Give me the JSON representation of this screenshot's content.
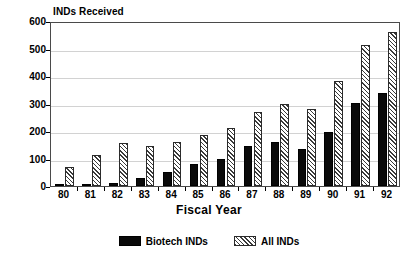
{
  "chart_data": {
    "type": "bar",
    "title": "",
    "ylabel": "INDs Received",
    "xlabel": "Fiscal Year",
    "categories": [
      "80",
      "81",
      "82",
      "83",
      "84",
      "85",
      "86",
      "87",
      "88",
      "89",
      "90",
      "91",
      "92"
    ],
    "series": [
      {
        "name": "Biotech INDs",
        "color": "#000000",
        "fill": "solid",
        "values": [
          2,
          7,
          11,
          30,
          50,
          80,
          98,
          145,
          160,
          133,
          197,
          302,
          337
        ]
      },
      {
        "name": "All INDs",
        "color": "#3a3a3a",
        "fill": "hatched",
        "values": [
          68,
          113,
          157,
          145,
          160,
          187,
          212,
          268,
          300,
          280,
          383,
          512,
          560
        ]
      }
    ],
    "ylim": [
      0,
      600
    ],
    "yticks": [
      0,
      100,
      200,
      300,
      400,
      500,
      600
    ],
    "ytick_labels": [
      "0",
      "100",
      "200",
      "300",
      "400",
      "500",
      "600"
    ],
    "grid": true,
    "legend_position": "bottom"
  },
  "legend": {
    "items": [
      {
        "label": "Biotech INDs",
        "swatch": "solid-black-swatch"
      },
      {
        "label": "All INDs",
        "swatch": "hatched-swatch"
      }
    ]
  }
}
